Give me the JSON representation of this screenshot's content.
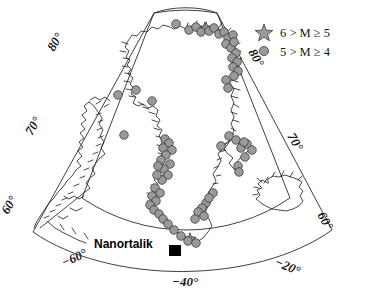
{
  "figure": {
    "type": "map",
    "projection": "conic",
    "region": "Greenland and surrounding North Atlantic / Baffin Bay",
    "background_color": "#ffffff",
    "coastline_color": "#1a1a1a",
    "marker_fill_color": "#9a9a9a",
    "marker_stroke_color": "#2b2b2b"
  },
  "legend": {
    "items": [
      {
        "symbol": "star",
        "label": "6 > M ≥ 5"
      },
      {
        "symbol": "circle",
        "label": "5 > M ≥ 4"
      }
    ]
  },
  "graticule": {
    "latitude_labels": [
      {
        "text": "80°",
        "side": "left"
      },
      {
        "text": "80°",
        "side": "right"
      },
      {
        "text": "70°",
        "side": "left"
      },
      {
        "text": "70°",
        "side": "right"
      },
      {
        "text": "60°",
        "side": "left"
      },
      {
        "text": "60°",
        "side": "right"
      }
    ],
    "longitude_labels": [
      {
        "text": "−60°",
        "side": "bottom-left"
      },
      {
        "text": "−40°",
        "side": "bottom-center"
      },
      {
        "text": "−20°",
        "side": "bottom-right"
      }
    ]
  },
  "annotations": [
    {
      "name": "city-marker",
      "label": "Nanortalik",
      "symbol": "filled-square"
    }
  ],
  "chart_data": {
    "type": "scatter",
    "title": "",
    "xlabel": "",
    "ylabel": "",
    "legend_position": "top-right",
    "series": [
      {
        "name": "6 > M ≥ 5",
        "symbol": "star",
        "points": [
          [
            206,
            28
          ],
          [
            190,
            239
          ]
        ]
      },
      {
        "name": "5 > M ≥ 4",
        "symbol": "circle",
        "points": [
          [
            176,
            24
          ],
          [
            189,
            30
          ],
          [
            196,
            27
          ],
          [
            201,
            32
          ],
          [
            209,
            31
          ],
          [
            214,
            28
          ],
          [
            219,
            34
          ],
          [
            224,
            32
          ],
          [
            228,
            38
          ],
          [
            233,
            35
          ],
          [
            226,
            44
          ],
          [
            231,
            48
          ],
          [
            234,
            42
          ],
          [
            236,
            53
          ],
          [
            232,
            58
          ],
          [
            237,
            62
          ],
          [
            233,
            67
          ],
          [
            238,
            71
          ],
          [
            234,
            76
          ],
          [
            226,
            80
          ],
          [
            228,
            88
          ],
          [
            118,
            95
          ],
          [
            136,
            90
          ],
          [
            152,
            101
          ],
          [
            124,
            135
          ],
          [
            165,
            139
          ],
          [
            169,
            143
          ],
          [
            163,
            148
          ],
          [
            172,
            150
          ],
          [
            166,
            155
          ],
          [
            161,
            160
          ],
          [
            170,
            164
          ],
          [
            164,
            169
          ],
          [
            158,
            166
          ],
          [
            168,
            175
          ],
          [
            162,
            180
          ],
          [
            157,
            175
          ],
          [
            155,
            188
          ],
          [
            160,
            193
          ],
          [
            152,
            196
          ],
          [
            156,
            201
          ],
          [
            150,
            205
          ],
          [
            154,
            210
          ],
          [
            159,
            214
          ],
          [
            163,
            219
          ],
          [
            168,
            224
          ],
          [
            174,
            230
          ],
          [
            181,
            236
          ],
          [
            188,
            241
          ],
          [
            196,
            243
          ],
          [
            229,
            136
          ],
          [
            236,
            140
          ],
          [
            241,
            148
          ],
          [
            247,
            144
          ],
          [
            252,
            150
          ],
          [
            245,
            157
          ],
          [
            221,
            146
          ],
          [
            238,
            166
          ],
          [
            239,
            172
          ],
          [
            213,
            193
          ],
          [
            206,
            203
          ],
          [
            202,
            208
          ],
          [
            198,
            212
          ],
          [
            204,
            216
          ],
          [
            209,
            198
          ],
          [
            195,
            219
          ],
          [
            244,
            142
          ]
        ]
      }
    ]
  }
}
